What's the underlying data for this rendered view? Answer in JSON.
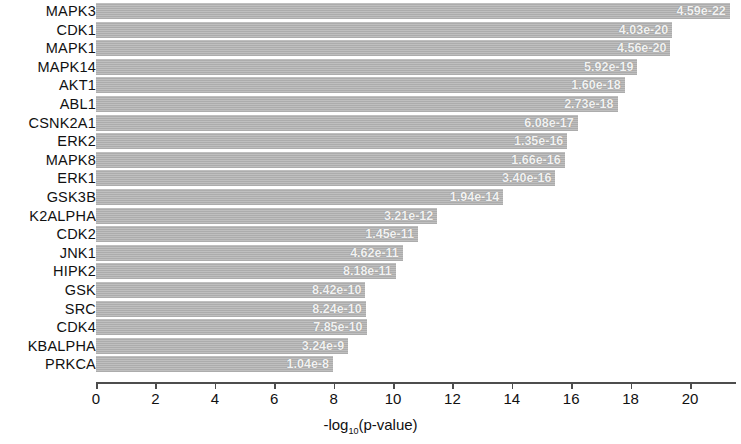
{
  "chart_data": {
    "type": "bar",
    "title": "",
    "subtitle": "",
    "orientation": "horizontal",
    "xlabel": "-log10(p-value)",
    "xlabel_parts": {
      "prefix": "-log",
      "subscript": "10",
      "suffix": "(p-value)"
    },
    "ylabel": "",
    "xlim": [
      0,
      21.6
    ],
    "xticks": [
      0,
      2,
      4,
      6,
      8,
      10,
      12,
      14,
      16,
      18,
      20
    ],
    "xticklabels": [
      "0",
      "2",
      "4",
      "6",
      "8",
      "10",
      "12",
      "14",
      "16",
      "18",
      "20"
    ],
    "grid": false,
    "legend": null,
    "bar_color": "#b3b3b3",
    "value_label_color": "#f2f2f2",
    "axis_color": "#4d4d4d",
    "categories": [
      "MAPK3",
      "CDK1",
      "MAPK1",
      "MAPK14",
      "AKT1",
      "ABL1",
      "CSNK2A1",
      "ERK2",
      "MAPK8",
      "ERK1",
      "GSK3B",
      "K2ALPHA",
      "CDK2",
      "JNK1",
      "HIPK2",
      "GSK",
      "SRC",
      "CDK4",
      "KBALPHA",
      "PRKCA"
    ],
    "values": [
      21.34,
      19.4,
      19.34,
      18.23,
      17.8,
      17.56,
      16.22,
      15.87,
      15.78,
      15.47,
      13.71,
      11.49,
      10.84,
      10.33,
      10.09,
      9.07,
      9.08,
      9.11,
      8.49,
      7.98
    ],
    "value_labels": [
      "4.59e-22",
      "4.03e-20",
      "4.56e-20",
      "5.92e-19",
      "1.60e-18",
      "2.73e-18",
      "6.08e-17",
      "1.35e-16",
      "1.66e-16",
      "3.40e-16",
      "1.94e-14",
      "3.21e-12",
      "1.45e-11",
      "4.62e-11",
      "8.18e-11",
      "8.42e-10",
      "8.24e-10",
      "7.85e-10",
      "3.24e-9",
      "1.04e-8"
    ],
    "pvalues": [
      "4.59e-22",
      "4.03e-20",
      "4.56e-20",
      "5.92e-19",
      "1.60e-18",
      "2.73e-18",
      "6.08e-17",
      "1.35e-16",
      "1.66e-16",
      "3.40e-16",
      "1.94e-14",
      "3.21e-12",
      "1.45e-11",
      "4.62e-11",
      "8.18e-11",
      "8.42e-10",
      "8.24e-10",
      "7.85e-10",
      "3.24e-9",
      "1.04e-8"
    ]
  }
}
